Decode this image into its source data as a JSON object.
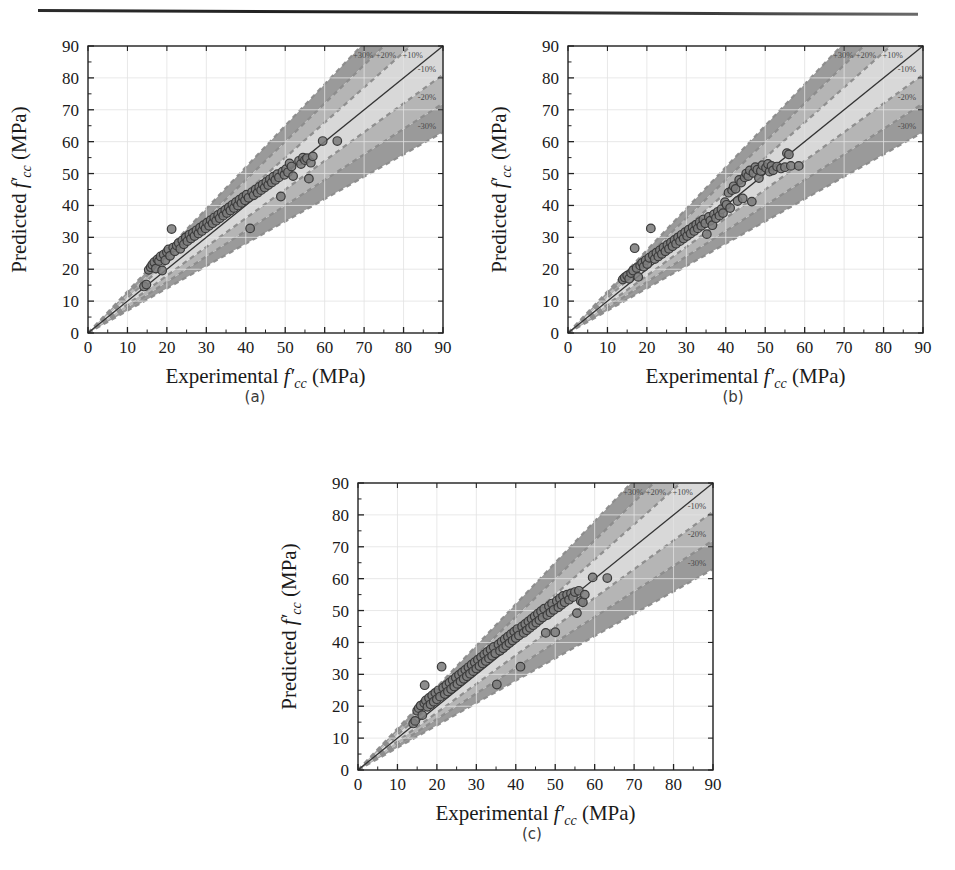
{
  "figure": {
    "panels": [
      {
        "id": "a",
        "caption": "(a)"
      },
      {
        "id": "b",
        "caption": "(b)"
      },
      {
        "id": "c",
        "caption": "(c)"
      }
    ]
  },
  "axes": {
    "xlabel_prefix": "Experimental ",
    "ylabel_prefix": "Predicted ",
    "var_f": "f",
    "var_prime": "′",
    "var_sub": "cc",
    "units": "(MPa)",
    "ticks": [
      0,
      10,
      20,
      30,
      40,
      50,
      60,
      70,
      80,
      90
    ],
    "xlim": [
      0,
      90
    ],
    "ylim": [
      0,
      90
    ]
  },
  "band_labels": {
    "top": [
      "+30%",
      "+20%",
      "+10%"
    ],
    "right": [
      "-10%",
      "-20%",
      "-30%"
    ]
  },
  "colors": {
    "band30": "#9a9a9a",
    "band20": "#b5b5b5",
    "band10": "#d8d8d8",
    "core": "#f2f2f2",
    "dash": "#8c8c8c",
    "identity_line": "#333333",
    "marker_fill": "#7d7d7d",
    "marker_stroke": "#3b3b3b",
    "axis": "#222222",
    "grid": "#e2e2e2",
    "text": "#1a1a1a"
  },
  "chart_data": [
    {
      "type": "scatter",
      "panel": "a",
      "title": "",
      "xlabel": "Experimental f'cc (MPa)",
      "ylabel": "Predicted f'cc (MPa)",
      "xlim": [
        0,
        90
      ],
      "ylim": [
        0,
        90
      ],
      "grid": true,
      "reference_line": {
        "slope": 1,
        "intercept": 0,
        "label": "1:1 line"
      },
      "error_bands_pct": [
        10,
        20,
        30
      ],
      "annotations": [
        "+30%",
        "+20%",
        "+10%",
        "-10%",
        "-20%",
        "-30%"
      ],
      "points": [
        [
          14.2,
          14.6
        ],
        [
          14.8,
          15.2
        ],
        [
          15.4,
          19.8
        ],
        [
          15.9,
          20.6
        ],
        [
          16.3,
          21.4
        ],
        [
          16.8,
          22.2
        ],
        [
          17.2,
          20.2
        ],
        [
          17.6,
          23.1
        ],
        [
          18.0,
          22.6
        ],
        [
          18.4,
          24.0
        ],
        [
          18.8,
          19.6
        ],
        [
          19.2,
          24.6
        ],
        [
          19.6,
          22.8
        ],
        [
          20.0,
          25.4
        ],
        [
          20.4,
          26.2
        ],
        [
          20.8,
          24.2
        ],
        [
          21.2,
          32.6
        ],
        [
          21.6,
          26.8
        ],
        [
          22.0,
          25.6
        ],
        [
          22.5,
          27.4
        ],
        [
          23.0,
          28.2
        ],
        [
          23.4,
          26.4
        ],
        [
          23.9,
          29.0
        ],
        [
          24.3,
          27.8
        ],
        [
          24.8,
          30.0
        ],
        [
          25.2,
          28.8
        ],
        [
          25.7,
          30.8
        ],
        [
          26.1,
          29.6
        ],
        [
          26.6,
          31.4
        ],
        [
          27.0,
          30.4
        ],
        [
          27.5,
          32.2
        ],
        [
          28.0,
          31.2
        ],
        [
          28.4,
          33.0
        ],
        [
          28.9,
          32.0
        ],
        [
          29.3,
          33.8
        ],
        [
          29.8,
          32.8
        ],
        [
          30.2,
          34.6
        ],
        [
          30.7,
          33.6
        ],
        [
          31.1,
          35.4
        ],
        [
          31.6,
          34.4
        ],
        [
          32.0,
          36.2
        ],
        [
          32.5,
          35.2
        ],
        [
          33.0,
          37.0
        ],
        [
          33.4,
          36.0
        ],
        [
          33.9,
          37.8
        ],
        [
          34.3,
          36.8
        ],
        [
          34.8,
          38.6
        ],
        [
          35.2,
          37.6
        ],
        [
          35.7,
          39.4
        ],
        [
          36.1,
          38.4
        ],
        [
          36.6,
          40.2
        ],
        [
          37.0,
          39.2
        ],
        [
          37.5,
          41.0
        ],
        [
          38.0,
          40.0
        ],
        [
          38.4,
          41.8
        ],
        [
          38.9,
          40.8
        ],
        [
          39.3,
          42.6
        ],
        [
          39.8,
          41.6
        ],
        [
          40.2,
          43.4
        ],
        [
          40.7,
          42.4
        ],
        [
          41.1,
          32.8
        ],
        [
          41.6,
          44.2
        ],
        [
          42.0,
          43.2
        ],
        [
          42.5,
          45.0
        ],
        [
          43.0,
          44.0
        ],
        [
          43.4,
          45.8
        ],
        [
          43.9,
          44.8
        ],
        [
          44.3,
          46.6
        ],
        [
          44.8,
          45.6
        ],
        [
          45.2,
          47.4
        ],
        [
          45.7,
          46.4
        ],
        [
          46.1,
          48.2
        ],
        [
          46.6,
          47.2
        ],
        [
          47.0,
          49.0
        ],
        [
          47.5,
          48.0
        ],
        [
          48.0,
          49.8
        ],
        [
          48.4,
          48.8
        ],
        [
          48.9,
          42.8
        ],
        [
          49.3,
          50.6
        ],
        [
          49.8,
          49.6
        ],
        [
          50.2,
          51.4
        ],
        [
          50.7,
          50.4
        ],
        [
          51.1,
          53.2
        ],
        [
          51.6,
          52.2
        ],
        [
          52.0,
          49.2
        ],
        [
          53.5,
          54.0
        ],
        [
          54.0,
          53.0
        ],
        [
          54.5,
          55.0
        ],
        [
          55.0,
          54.2
        ],
        [
          55.5,
          54.8
        ],
        [
          56.0,
          48.4
        ],
        [
          56.5,
          53.4
        ],
        [
          57.0,
          55.4
        ],
        [
          59.5,
          60.2
        ],
        [
          63.2,
          60.2
        ]
      ]
    },
    {
      "type": "scatter",
      "panel": "b",
      "title": "",
      "xlabel": "Experimental f'cc (MPa)",
      "ylabel": "Predicted f'cc (MPa)",
      "xlim": [
        0,
        90
      ],
      "ylim": [
        0,
        90
      ],
      "grid": true,
      "reference_line": {
        "slope": 1,
        "intercept": 0,
        "label": "1:1 line"
      },
      "error_bands_pct": [
        10,
        20,
        30
      ],
      "annotations": [
        "+30%",
        "+20%",
        "+10%",
        "-10%",
        "-20%",
        "-30%"
      ],
      "points": [
        [
          13.9,
          16.8
        ],
        [
          14.4,
          17.4
        ],
        [
          15.0,
          18.0
        ],
        [
          15.5,
          17.0
        ],
        [
          16.0,
          18.8
        ],
        [
          16.5,
          19.6
        ],
        [
          16.9,
          26.6
        ],
        [
          17.4,
          20.4
        ],
        [
          17.8,
          17.6
        ],
        [
          18.3,
          21.2
        ],
        [
          18.8,
          22.0
        ],
        [
          19.2,
          20.8
        ],
        [
          19.7,
          22.8
        ],
        [
          20.1,
          21.6
        ],
        [
          20.6,
          23.6
        ],
        [
          21.0,
          32.8
        ],
        [
          21.5,
          24.4
        ],
        [
          22.0,
          23.2
        ],
        [
          22.4,
          25.2
        ],
        [
          22.9,
          24.0
        ],
        [
          23.3,
          26.0
        ],
        [
          23.8,
          24.8
        ],
        [
          24.2,
          26.8
        ],
        [
          24.7,
          25.6
        ],
        [
          25.2,
          27.6
        ],
        [
          25.6,
          26.4
        ],
        [
          26.1,
          28.4
        ],
        [
          26.5,
          27.2
        ],
        [
          27.0,
          29.2
        ],
        [
          27.4,
          28.0
        ],
        [
          27.9,
          30.0
        ],
        [
          28.4,
          28.8
        ],
        [
          28.8,
          30.8
        ],
        [
          29.3,
          29.6
        ],
        [
          29.7,
          31.6
        ],
        [
          30.2,
          30.4
        ],
        [
          30.6,
          32.4
        ],
        [
          31.1,
          31.2
        ],
        [
          31.6,
          33.2
        ],
        [
          32.0,
          32.0
        ],
        [
          32.5,
          34.0
        ],
        [
          32.9,
          32.8
        ],
        [
          33.4,
          34.8
        ],
        [
          33.8,
          33.6
        ],
        [
          34.3,
          35.6
        ],
        [
          34.8,
          34.4
        ],
        [
          35.2,
          31.0
        ],
        [
          35.7,
          36.4
        ],
        [
          36.1,
          35.2
        ],
        [
          36.6,
          33.8
        ],
        [
          37.0,
          37.2
        ],
        [
          37.5,
          36.0
        ],
        [
          38.0,
          38.0
        ],
        [
          38.4,
          36.8
        ],
        [
          38.9,
          38.8
        ],
        [
          39.3,
          37.6
        ],
        [
          39.8,
          41.0
        ],
        [
          40.2,
          40.2
        ],
        [
          40.7,
          44.0
        ],
        [
          41.1,
          39.2
        ],
        [
          41.6,
          44.8
        ],
        [
          42.0,
          46.0
        ],
        [
          42.5,
          45.2
        ],
        [
          43.0,
          41.4
        ],
        [
          43.4,
          48.0
        ],
        [
          43.9,
          47.2
        ],
        [
          44.3,
          42.2
        ],
        [
          44.8,
          48.8
        ],
        [
          45.2,
          50.0
        ],
        [
          45.7,
          49.2
        ],
        [
          46.1,
          51.0
        ],
        [
          46.6,
          41.2
        ],
        [
          47.0,
          50.2
        ],
        [
          47.5,
          52.0
        ],
        [
          48.0,
          51.2
        ],
        [
          48.4,
          48.6
        ],
        [
          48.9,
          50.8
        ],
        [
          49.3,
          52.6
        ],
        [
          50.2,
          51.8
        ],
        [
          50.7,
          53.0
        ],
        [
          51.1,
          50.6
        ],
        [
          51.6,
          52.4
        ],
        [
          52.0,
          51.0
        ],
        [
          53.0,
          52.2
        ],
        [
          54.0,
          51.6
        ],
        [
          55.0,
          52.0
        ],
        [
          55.5,
          56.4
        ],
        [
          56.0,
          56.0
        ],
        [
          56.5,
          52.4
        ],
        [
          58.5,
          52.4
        ]
      ]
    },
    {
      "type": "scatter",
      "panel": "c",
      "title": "",
      "xlabel": "Experimental f'cc (MPa)",
      "ylabel": "Predicted f'cc (MPa)",
      "xlim": [
        0,
        90
      ],
      "ylim": [
        0,
        90
      ],
      "grid": true,
      "reference_line": {
        "slope": 1,
        "intercept": 0,
        "label": "1:1 line"
      },
      "error_bands_pct": [
        10,
        20,
        30
      ],
      "annotations": [
        "+30%",
        "+20%",
        "+10%",
        "-10%",
        "-20%",
        "-30%"
      ],
      "points": [
        [
          14.0,
          14.6
        ],
        [
          14.5,
          15.4
        ],
        [
          15.0,
          18.6
        ],
        [
          15.4,
          19.4
        ],
        [
          15.9,
          20.2
        ],
        [
          16.3,
          17.2
        ],
        [
          16.8,
          21.0
        ],
        [
          16.9,
          26.6
        ],
        [
          17.2,
          21.8
        ],
        [
          17.6,
          19.8
        ],
        [
          18.0,
          22.6
        ],
        [
          18.4,
          20.6
        ],
        [
          18.8,
          23.4
        ],
        [
          19.2,
          21.4
        ],
        [
          19.6,
          24.2
        ],
        [
          20.0,
          22.2
        ],
        [
          20.4,
          25.0
        ],
        [
          20.8,
          23.0
        ],
        [
          21.2,
          32.4
        ],
        [
          21.6,
          25.8
        ],
        [
          22.0,
          23.8
        ],
        [
          22.4,
          26.6
        ],
        [
          22.8,
          24.6
        ],
        [
          23.2,
          27.4
        ],
        [
          23.6,
          25.4
        ],
        [
          24.0,
          28.2
        ],
        [
          24.4,
          26.2
        ],
        [
          24.8,
          29.0
        ],
        [
          25.2,
          27.0
        ],
        [
          25.6,
          29.8
        ],
        [
          26.0,
          27.8
        ],
        [
          26.4,
          30.6
        ],
        [
          26.8,
          28.6
        ],
        [
          27.2,
          31.4
        ],
        [
          27.6,
          29.4
        ],
        [
          28.0,
          32.2
        ],
        [
          28.4,
          30.2
        ],
        [
          28.8,
          33.0
        ],
        [
          29.2,
          31.0
        ],
        [
          29.6,
          33.8
        ],
        [
          30.0,
          31.8
        ],
        [
          30.4,
          34.6
        ],
        [
          30.8,
          32.6
        ],
        [
          31.2,
          35.4
        ],
        [
          31.6,
          33.4
        ],
        [
          32.0,
          36.2
        ],
        [
          32.4,
          34.2
        ],
        [
          32.8,
          37.0
        ],
        [
          33.2,
          35.0
        ],
        [
          33.6,
          37.8
        ],
        [
          34.0,
          35.8
        ],
        [
          34.4,
          38.6
        ],
        [
          34.8,
          36.6
        ],
        [
          35.2,
          26.8
        ],
        [
          35.6,
          39.4
        ],
        [
          36.0,
          37.4
        ],
        [
          36.4,
          40.2
        ],
        [
          36.8,
          38.2
        ],
        [
          37.2,
          41.0
        ],
        [
          37.6,
          39.0
        ],
        [
          38.0,
          41.8
        ],
        [
          38.4,
          39.8
        ],
        [
          38.8,
          42.6
        ],
        [
          39.2,
          40.6
        ],
        [
          39.6,
          43.4
        ],
        [
          40.0,
          41.4
        ],
        [
          40.4,
          44.2
        ],
        [
          40.8,
          42.2
        ],
        [
          41.2,
          32.4
        ],
        [
          41.6,
          45.0
        ],
        [
          42.0,
          43.0
        ],
        [
          42.4,
          45.8
        ],
        [
          42.8,
          43.8
        ],
        [
          43.2,
          46.6
        ],
        [
          43.6,
          44.6
        ],
        [
          44.0,
          47.4
        ],
        [
          44.4,
          45.4
        ],
        [
          44.8,
          48.2
        ],
        [
          45.2,
          46.2
        ],
        [
          45.6,
          49.0
        ],
        [
          46.0,
          47.0
        ],
        [
          46.4,
          49.8
        ],
        [
          46.8,
          47.8
        ],
        [
          47.2,
          50.6
        ],
        [
          47.6,
          43.0
        ],
        [
          48.0,
          48.6
        ],
        [
          48.4,
          51.4
        ],
        [
          48.8,
          49.4
        ],
        [
          49.2,
          52.2
        ],
        [
          49.6,
          50.2
        ],
        [
          50.0,
          43.2
        ],
        [
          50.4,
          53.0
        ],
        [
          50.8,
          51.0
        ],
        [
          51.2,
          53.8
        ],
        [
          51.6,
          51.8
        ],
        [
          52.0,
          54.6
        ],
        [
          52.4,
          52.6
        ],
        [
          53.0,
          55.0
        ],
        [
          53.5,
          53.4
        ],
        [
          54.0,
          55.4
        ],
        [
          54.5,
          54.2
        ],
        [
          55.0,
          55.8
        ],
        [
          55.5,
          49.2
        ],
        [
          56.0,
          56.2
        ],
        [
          56.5,
          53.0
        ],
        [
          57.0,
          52.6
        ],
        [
          57.5,
          55.0
        ],
        [
          59.5,
          60.4
        ],
        [
          63.2,
          60.2
        ]
      ]
    }
  ]
}
